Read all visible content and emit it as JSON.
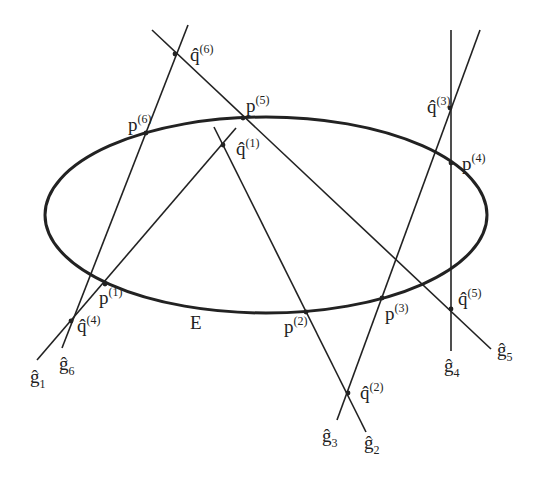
{
  "figure": {
    "ellipse_label": "E",
    "stroke_color": "#222222",
    "background": "#ffffff",
    "ellipse": {
      "cx": 266,
      "cy": 215,
      "rx": 221,
      "ry": 98
    },
    "lines": [
      {
        "id": "g1",
        "label": "ĝ",
        "index": "1",
        "x1": 37,
        "y1": 360,
        "x2": 236,
        "y2": 128
      },
      {
        "id": "g2",
        "label": "ĝ",
        "index": "2",
        "x1": 366,
        "y1": 432,
        "x2": 214,
        "y2": 127
      },
      {
        "id": "g3",
        "label": "ĝ",
        "index": "3",
        "x1": 337,
        "y1": 420,
        "x2": 480,
        "y2": 30
      },
      {
        "id": "g4",
        "label": "ĝ",
        "index": "4",
        "x1": 451,
        "y1": 351,
        "x2": 451,
        "y2": 30
      },
      {
        "id": "g5",
        "label": "ĝ",
        "index": "5",
        "x1": 491,
        "y1": 349,
        "x2": 152,
        "y2": 30
      },
      {
        "id": "g6",
        "label": "ĝ",
        "index": "6",
        "x1": 62,
        "y1": 348,
        "x2": 188,
        "y2": 25
      }
    ],
    "line_labels": [
      {
        "text": "ĝ",
        "sub": "1",
        "x": 30,
        "y": 383
      },
      {
        "text": "ĝ",
        "sub": "6",
        "x": 59,
        "y": 370
      },
      {
        "text": "ĝ",
        "sub": "3",
        "x": 322,
        "y": 442
      },
      {
        "text": "ĝ",
        "sub": "2",
        "x": 364,
        "y": 449
      },
      {
        "text": "ĝ",
        "sub": "4",
        "x": 444,
        "y": 372
      },
      {
        "text": "ĝ",
        "sub": "5",
        "x": 497,
        "y": 356
      }
    ],
    "points_p": [
      {
        "name": "p",
        "sup": "(1)",
        "x": 105,
        "y": 284,
        "lx": 99,
        "ly": 304
      },
      {
        "name": "p",
        "sup": "(2)",
        "x": 306,
        "y": 312,
        "lx": 284,
        "ly": 333
      },
      {
        "name": "p",
        "sup": "(3)",
        "x": 382,
        "y": 298,
        "lx": 385,
        "ly": 320
      },
      {
        "name": "p",
        "sup": "(4)",
        "x": 451,
        "y": 163,
        "lx": 462,
        "ly": 170
      },
      {
        "name": "p",
        "sup": "(5)",
        "x": 243,
        "y": 118,
        "lx": 246,
        "ly": 112
      },
      {
        "name": "p",
        "sup": "(6)",
        "x": 146,
        "y": 133,
        "lx": 128,
        "ly": 131
      }
    ],
    "points_q": [
      {
        "name": "q̂",
        "sup": "(1)",
        "x": 223,
        "y": 145,
        "lx": 236,
        "ly": 155
      },
      {
        "name": "q̂",
        "sup": "(2)",
        "x": 348,
        "y": 393,
        "lx": 360,
        "ly": 399
      },
      {
        "name": "q̂",
        "sup": "(3)",
        "x": 450,
        "y": 108,
        "lx": 427,
        "ly": 113
      },
      {
        "name": "q̂",
        "sup": "(4)",
        "x": 71,
        "y": 321,
        "lx": 77,
        "ly": 332
      },
      {
        "name": "q̂",
        "sup": "(5)",
        "x": 451,
        "y": 309,
        "lx": 458,
        "ly": 305
      },
      {
        "name": "q̂",
        "sup": "(6)",
        "x": 175,
        "y": 54,
        "lx": 190,
        "ly": 61
      }
    ],
    "ellipse_label_pos": {
      "x": 190,
      "y": 329
    }
  }
}
